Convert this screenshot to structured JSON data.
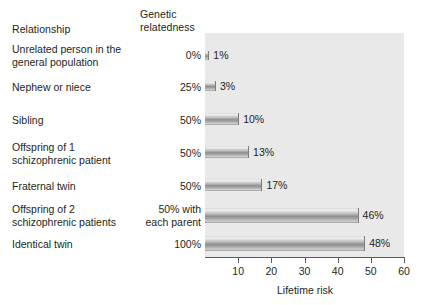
{
  "headers": {
    "relationship": "Relationship",
    "genetic_relatedness": "Genetic\nrelatedness"
  },
  "axis": {
    "x_title": "Lifetime risk",
    "x_ticks": [
      "10",
      "20",
      "30",
      "40",
      "50",
      "60"
    ],
    "x_min": 0,
    "x_max": 60
  },
  "chart_data": {
    "type": "bar",
    "orientation": "horizontal",
    "title": "",
    "xlabel": "Lifetime risk",
    "ylabel": "Relationship",
    "xlim": [
      0,
      60
    ],
    "grid": false,
    "legend": null,
    "categories": [
      "Unrelated person in the\ngeneral population",
      "Nephew or niece",
      "Sibling",
      "Offspring of 1\nschizophrenic patient",
      "Fraternal twin",
      "Offspring of 2\nschizophrenic patients",
      "Identical twin"
    ],
    "values": [
      1,
      3,
      10,
      13,
      17,
      46,
      48
    ],
    "value_labels": [
      "1%",
      "3%",
      "10%",
      "13%",
      "17%",
      "46%",
      "48%"
    ],
    "genetic_relatedness": [
      "0%",
      "25%",
      "50%",
      "50%",
      "50%",
      "50% with\neach parent",
      "100%"
    ],
    "xticks": [
      10,
      20,
      30,
      40,
      50,
      60
    ]
  },
  "colors": {
    "plot_background": "#e9e9e9",
    "page_background": "#ffffff",
    "bar_mid": "#8f8f8f",
    "bar_light": "#f0f0f0",
    "axis": "#5a5a5a",
    "text": "#231f20"
  }
}
